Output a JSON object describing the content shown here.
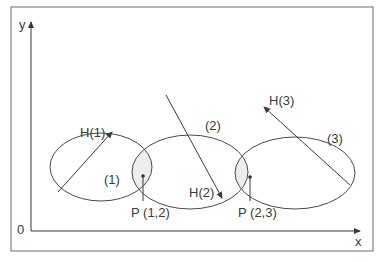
{
  "diagram": {
    "axes": {
      "y_label": "y",
      "x_label": "x",
      "origin_label": "0"
    },
    "regions": [
      {
        "id": "1",
        "label": "(1)",
        "hint_label": "H(1)"
      },
      {
        "id": "2",
        "label": "(2)",
        "hint_label": "H(2)"
      },
      {
        "id": "3",
        "label": "(3)",
        "hint_label": "H(3)"
      }
    ],
    "points": [
      {
        "label": "P (1,2)"
      },
      {
        "label": "P (2,3)"
      }
    ],
    "colors": {
      "stroke": "#4a4a4a",
      "overlap_fill": "#ececec",
      "background": "#ffffff"
    }
  }
}
